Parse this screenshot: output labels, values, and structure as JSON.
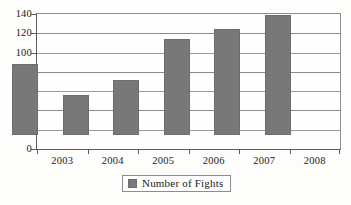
{
  "chart_data": {
    "type": "bar",
    "title": "",
    "subtitle": "",
    "xlabel": "",
    "ylabel": "",
    "categories": [
      "2003",
      "2004",
      "2005",
      "2006",
      "2007",
      "2008"
    ],
    "series": [
      {
        "name": "Number of Fights",
        "values": [
          74,
          42,
          57,
          100,
          110,
          124
        ],
        "color": "#787878"
      }
    ],
    "ylim": [
      0,
      140
    ],
    "yticks": [
      0,
      20,
      40,
      60,
      80,
      100,
      120,
      140
    ],
    "ytick_labels": [
      "0",
      "20",
      "40",
      "60",
      "80",
      "100",
      "120",
      "140"
    ],
    "grid": true,
    "grid_axis": "y",
    "legend": {
      "position": "bottom-center",
      "entries": [
        {
          "label": "Number of Fights",
          "swatch_color": "#787878"
        }
      ]
    },
    "axis_color": "#5a5a5a",
    "gridline_color": "#9a9a9a",
    "background_color": "#fdfdfc"
  }
}
